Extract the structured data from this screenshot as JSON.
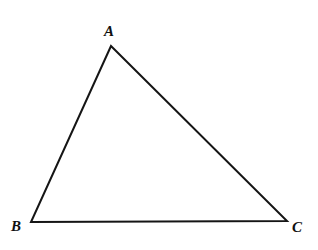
{
  "figure": {
    "kind": "geometry-diagram",
    "width": 318,
    "height": 250,
    "background_color": "#ffffff",
    "stroke_color": "#151515",
    "stroke_width": 2,
    "label_color": "#101010"
  },
  "vertices": [
    {
      "id": "A",
      "label": "A",
      "x": 111,
      "y": 46,
      "label_x": 110,
      "label_y": 31
    },
    {
      "id": "B",
      "label": "B",
      "x": 31,
      "y": 222,
      "label_x": 16,
      "label_y": 226
    },
    {
      "id": "C",
      "label": "C",
      "x": 287,
      "y": 221,
      "label_x": 297,
      "label_y": 227
    }
  ],
  "edges": [
    {
      "id": "AB",
      "from": "A",
      "to": "B"
    },
    {
      "id": "AC",
      "from": "A",
      "to": "C"
    },
    {
      "id": "BC",
      "from": "B",
      "to": "C"
    }
  ],
  "polygon_points": "111,46 31,222 287,221"
}
